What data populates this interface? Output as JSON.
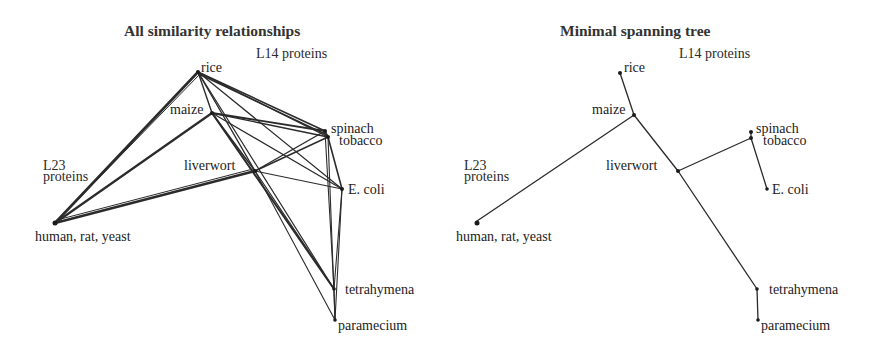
{
  "panels": [
    {
      "title": "All similarity relationships",
      "group_labels": {
        "l14": "L14 proteins",
        "l23_line1": "L23",
        "l23_line2": "proteins"
      },
      "nodes": {
        "rice": "rice",
        "maize": "maize",
        "spinach": "spinach",
        "tobacco": "tobacco",
        "liverwort": "liverwort",
        "ecoli": "E. coli",
        "human": "human, rat, yeast",
        "tetrahymena": "tetrahymena",
        "paramecium": "paramecium"
      }
    },
    {
      "title": "Minimal spanning tree",
      "group_labels": {
        "l14": "L14 proteins",
        "l23_line1": "L23",
        "l23_line2": "proteins"
      },
      "nodes": {
        "rice": "rice",
        "maize": "maize",
        "spinach": "spinach",
        "tobacco": "tobacco",
        "liverwort": "liverwort",
        "ecoli": "E. coli",
        "human": "human, rat, yeast",
        "tetrahymena": "tetrahymena",
        "paramecium": "paramecium"
      }
    }
  ],
  "graph": {
    "edge_color": "#2b2b2b",
    "node_color": "#1a1a1a",
    "all_edges": [
      [
        "rice",
        "human"
      ],
      [
        "maize",
        "human"
      ],
      [
        "liverwort",
        "human"
      ],
      [
        "rice",
        "maize"
      ],
      [
        "rice",
        "spinach"
      ],
      [
        "rice",
        "tobacco"
      ],
      [
        "rice",
        "ecoli"
      ],
      [
        "rice",
        "liverwort"
      ],
      [
        "rice",
        "tetrahymena"
      ],
      [
        "maize",
        "spinach"
      ],
      [
        "maize",
        "tobacco"
      ],
      [
        "maize",
        "ecoli"
      ],
      [
        "maize",
        "liverwort"
      ],
      [
        "maize",
        "tetrahymena"
      ],
      [
        "liverwort",
        "spinach"
      ],
      [
        "liverwort",
        "tobacco"
      ],
      [
        "liverwort",
        "ecoli"
      ],
      [
        "liverwort",
        "tetrahymena"
      ],
      [
        "liverwort",
        "paramecium"
      ],
      [
        "spinach",
        "tobacco"
      ],
      [
        "spinach",
        "tetrahymena"
      ],
      [
        "tobacco",
        "ecoli"
      ],
      [
        "tobacco",
        "paramecium"
      ],
      [
        "ecoli",
        "tetrahymena"
      ],
      [
        "ecoli",
        "paramecium"
      ],
      [
        "tetrahymena",
        "paramecium"
      ]
    ],
    "tree_edges": [
      [
        "rice",
        "maize"
      ],
      [
        "maize",
        "human"
      ],
      [
        "maize",
        "liverwort"
      ],
      [
        "liverwort",
        "tobacco"
      ],
      [
        "spinach",
        "tobacco"
      ],
      [
        "tobacco",
        "ecoli"
      ],
      [
        "liverwort",
        "tetrahymena"
      ],
      [
        "tetrahymena",
        "paramecium"
      ]
    ]
  }
}
